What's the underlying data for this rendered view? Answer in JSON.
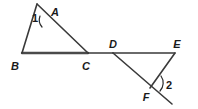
{
  "figure": {
    "background_color": "#ffffff",
    "stroke_color": "#3a3a3a",
    "label_color": "#1a1a1a",
    "width": 198,
    "height": 109,
    "vertex_labels": {
      "A": "A",
      "B": "B",
      "C": "C",
      "D": "D",
      "E": "E",
      "F": "F"
    },
    "angle_labels": {
      "one": "1",
      "two": "2"
    },
    "points": {
      "A": {
        "x": 47,
        "y": 13
      },
      "B": {
        "x": 22,
        "y": 53
      },
      "C": {
        "x": 88,
        "y": 53
      },
      "D": {
        "x": 113,
        "y": 53
      },
      "E": {
        "x": 175,
        "y": 53
      },
      "F": {
        "x": 150,
        "y": 88
      },
      "transversal_top_left": {
        "x": 37,
        "y": 4
      },
      "transversal_bottom_right": {
        "x": 172,
        "y": 104
      }
    },
    "segments": [
      {
        "name": "segment-BC",
        "from": "B",
        "to": "C",
        "weight": "heavy"
      },
      {
        "name": "segment-CD",
        "from": "C",
        "to": "D",
        "weight": "normal"
      },
      {
        "name": "segment-DE",
        "from": "D",
        "to": "E",
        "weight": "normal"
      },
      {
        "name": "segment-AB",
        "from": "A",
        "to": "B",
        "weight": "normal"
      },
      {
        "name": "segment-AC-extended",
        "from": "A",
        "to": "C",
        "weight": "normal"
      },
      {
        "name": "segment-DF",
        "from": "D",
        "to": "F",
        "weight": "normal"
      },
      {
        "name": "segment-EF",
        "from": "E",
        "to": "F",
        "weight": "normal"
      }
    ]
  }
}
